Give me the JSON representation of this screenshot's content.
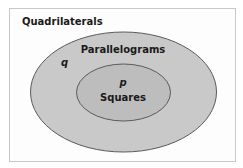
{
  "diagram": {
    "type": "venn-nested",
    "universe": {
      "label": "Quadrilaterals"
    },
    "outer_set": {
      "label": "Parallelograms",
      "variable": "q",
      "fill": "#c9c9c9",
      "stroke": "#5a5a5a"
    },
    "inner_set": {
      "label": "Squares",
      "variable": "p",
      "fill": "#bdbdbd",
      "stroke": "#5a5a5a"
    }
  }
}
